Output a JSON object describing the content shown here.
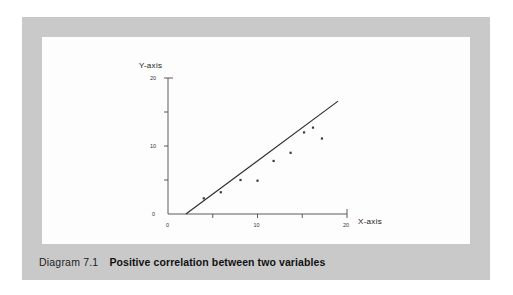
{
  "figure": {
    "caption_number": "Diagram 7.1",
    "caption_title": "Positive correlation between two variables",
    "frame_color": "#c9c9c9",
    "panel_color": "#fdfdfd"
  },
  "chart_data": {
    "type": "scatter",
    "title": "",
    "subtitle": "",
    "xlabel": "X-axis",
    "ylabel": "Y-axis",
    "xlim": [
      0,
      21
    ],
    "ylim": [
      0,
      21
    ],
    "grid": false,
    "legend": "none",
    "x_ticks": [
      0,
      5,
      10,
      15,
      20
    ],
    "x_tick_labels": [
      "0",
      "",
      "10",
      "",
      "20"
    ],
    "y_ticks": [
      0,
      5,
      10,
      15,
      20
    ],
    "y_tick_labels": [
      "0",
      "",
      "10",
      "",
      "20"
    ],
    "axis_color": "#4a4a4a",
    "point_color": "#3a3a3a",
    "line_color": "#2b2b2b",
    "points": [
      {
        "x": 4.0,
        "y": 2.3
      },
      {
        "x": 5.9,
        "y": 3.2
      },
      {
        "x": 8.1,
        "y": 5.0
      },
      {
        "x": 10.0,
        "y": 4.9
      },
      {
        "x": 11.8,
        "y": 7.8
      },
      {
        "x": 13.7,
        "y": 9.0
      },
      {
        "x": 15.2,
        "y": 12.0
      },
      {
        "x": 16.2,
        "y": 12.7
      },
      {
        "x": 17.2,
        "y": 11.1
      }
    ],
    "trend_line": {
      "name": "line of best fit",
      "x_start": 2.0,
      "y_start": 0.0,
      "x_end": 19.0,
      "y_end": 16.6
    }
  }
}
